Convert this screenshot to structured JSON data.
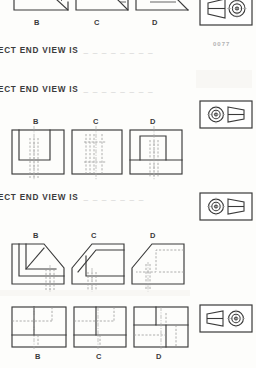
{
  "document": {
    "kind": "engineering-drawing-worksheet",
    "page_number": "0077",
    "ink_color": "#3a3a3a",
    "hidden_line_color": "#9a9a9a",
    "paper_color": "#fdfdfb"
  },
  "questions": [
    {
      "id": "q1",
      "text": "ECT END VIEW IS",
      "blank": "_ _ _ _ _ _ _  _"
    },
    {
      "id": "q2",
      "text": "ECT END VIEW IS",
      "blank": "_ _ _ _ _ _ _ _"
    },
    {
      "id": "q3",
      "text": "ECT END VIEW IS",
      "blank": "_ _ _ _ _ _ _"
    }
  ],
  "option_rows": [
    {
      "id": "row-top",
      "description": "partially cropped beveled block end views",
      "options": [
        {
          "letter": "B"
        },
        {
          "letter": "C"
        },
        {
          "letter": "D"
        }
      ]
    },
    {
      "id": "row-2",
      "description": "square end views with inner rectangle and hidden lines",
      "options": [
        {
          "letter": "B"
        },
        {
          "letter": "C"
        },
        {
          "letter": "D"
        }
      ]
    },
    {
      "id": "row-3",
      "description": "L-shaped chamfered end views",
      "options": [
        {
          "letter": "B"
        },
        {
          "letter": "C"
        },
        {
          "letter": "D"
        }
      ]
    },
    {
      "id": "row-4",
      "description": "rectangular end views with internal partitions",
      "options": [
        {
          "letter": "B"
        },
        {
          "letter": "C"
        },
        {
          "letter": "D"
        }
      ]
    }
  ],
  "pictorials": [
    {
      "id": "pict-1",
      "description": "tapered wedge with concentric circle boss, circle at right"
    },
    {
      "id": "pict-2",
      "description": "concentric circle boss at left with tapered wedge at right"
    },
    {
      "id": "pict-3",
      "description": "concentric circle boss at left with tapered wedge at right"
    },
    {
      "id": "pict-4",
      "description": "tapered wedge with concentric circle boss, circle at right"
    }
  ]
}
